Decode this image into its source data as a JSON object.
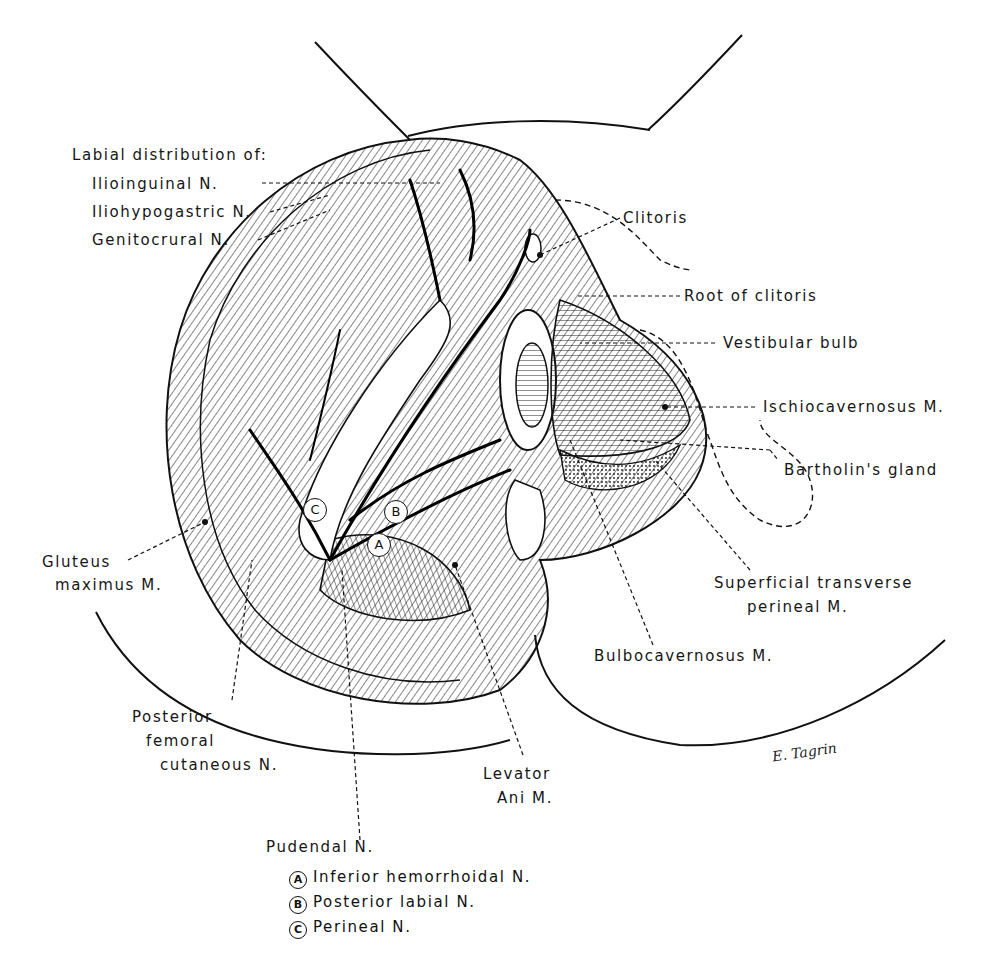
{
  "figure": {
    "labels": {
      "labial_heading": "Labial distribution of:",
      "ilioinguinal": "Ilioinguinal N.",
      "iliohypogastric": "Iliohypogastric N.",
      "genitocrural": "Genitocrural N.",
      "clitoris": "Clitoris",
      "root_of_clitoris": "Root of clitoris",
      "vestibular_bulb": "Vestibular bulb",
      "ischiocavernosus": "Ischiocavernosus M.",
      "bartholins_gland": "Bartholin's gland",
      "gluteus_line1": "Gluteus",
      "gluteus_line2": "maximus M.",
      "superficial_line1": "Superficial transverse",
      "superficial_line2": "perineal M.",
      "bulbocavernosus": "Bulbocavernosus M.",
      "posterior_line1": "Posterior",
      "posterior_line2": "femoral",
      "posterior_line3": "cutaneous N.",
      "levator_line1": "Levator",
      "levator_line2": "Ani M.",
      "pudendal": "Pudendal N."
    },
    "on_figure_markers": {
      "a": "A",
      "b": "B",
      "c": "C"
    },
    "legend": [
      {
        "marker": "A",
        "text": "Inferior hemorrhoidal N."
      },
      {
        "marker": "B",
        "text": "Posterior labial N."
      },
      {
        "marker": "C",
        "text": "Perineal N."
      }
    ],
    "signature": "E. Tagrin"
  }
}
